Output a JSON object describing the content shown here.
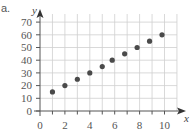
{
  "part_label": "a.",
  "chart_data": {
    "type": "scatter",
    "title": "",
    "xlabel": "x",
    "ylabel": "y",
    "xlim": [
      0,
      11
    ],
    "ylim": [
      0,
      75
    ],
    "grid": true,
    "legend": null,
    "x_ticks": [
      0,
      2,
      4,
      6,
      8,
      10
    ],
    "x_tick_labels": [
      "0",
      "2",
      "4",
      "6",
      "8",
      "10"
    ],
    "y_ticks": [
      0,
      10,
      20,
      30,
      40,
      50,
      60,
      70
    ],
    "y_tick_labels": [
      "0",
      "10",
      "20",
      "30",
      "40",
      "50",
      "60",
      "70"
    ],
    "x": [
      1,
      2,
      3,
      4,
      5,
      5.8,
      6.8,
      7.8,
      8.8,
      9.8
    ],
    "y": [
      15,
      20,
      25,
      30,
      35,
      40,
      45,
      50,
      55,
      60
    ],
    "point_color": "#4a4a4a",
    "grid_color": "#cfcfcf"
  }
}
